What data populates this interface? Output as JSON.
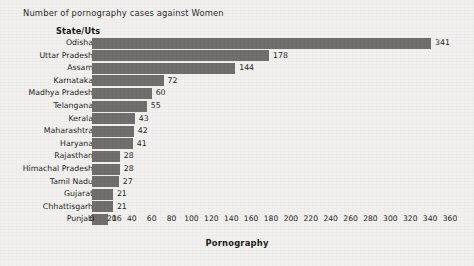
{
  "chart_data": {
    "type": "bar",
    "orientation": "horizontal",
    "title": "Number of pornography cases against Women",
    "category_header": "State/Uts",
    "xlabel": "Pornography",
    "ylabel": "State/Uts",
    "xlim": [
      0,
      360
    ],
    "xticks": [
      0,
      20,
      40,
      60,
      80,
      100,
      120,
      140,
      160,
      180,
      200,
      220,
      240,
      260,
      280,
      300,
      320,
      340,
      360
    ],
    "grid": false,
    "legend": null,
    "bar_color": "#706f6d",
    "background_color": "#f3f1ef",
    "categories": [
      "Odisha",
      "Uttar Pradesh",
      "Assam",
      "Karnataka",
      "Madhya Pradesh",
      "Telangana",
      "Kerala",
      "Maharashtra",
      "Haryana",
      "Rajasthan",
      "Himachal Pradesh",
      "Tamil Nadu",
      "Gujarat",
      "Chhattisgarh",
      "Punjab"
    ],
    "values": [
      341,
      178,
      144,
      72,
      60,
      55,
      43,
      42,
      41,
      28,
      28,
      27,
      21,
      21,
      16
    ],
    "data_labels": [
      "341",
      "178",
      "144",
      "72",
      "60",
      "55",
      "43",
      "42",
      "41",
      "28",
      "28",
      "27",
      "21",
      "21",
      "16"
    ]
  }
}
